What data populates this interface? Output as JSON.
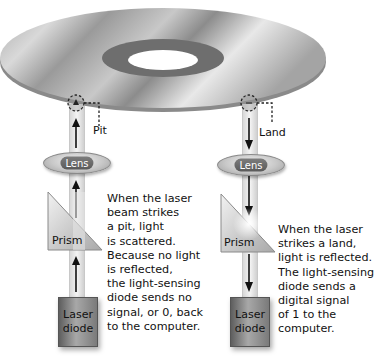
{
  "diagram": {
    "left": {
      "marker_label": "Pit",
      "lens_label": "Lens",
      "prism_label": "Prism",
      "diode_line1": "Laser",
      "diode_line2": "diode",
      "beam_direction": "up",
      "description": "When the laser\nbeam strikes\na pit, light\nis scattered.\nBecause no light\nis reflected,\nthe light-sensing\ndiode sends no\nsignal, or 0, back\nto the computer."
    },
    "right": {
      "marker_label": "Land",
      "lens_label": "Lens",
      "prism_label": "Prism",
      "diode_line1": "Laser",
      "diode_line2": "diode",
      "beam_direction": "down",
      "description": "When the laser\nstrikes a land,\nlight is reflected.\nThe light-sensing\ndiode sends a\ndigital signal\nof 1 to the\ncomputer."
    },
    "colors": {
      "disc_light": "#e4e4e4",
      "disc_dark": "#8c8c8c",
      "hub_ring": "#6e6e6e",
      "beam": "#e6e6e6",
      "arrow": "#111111",
      "lens_pill": "#6a6a6a"
    }
  }
}
